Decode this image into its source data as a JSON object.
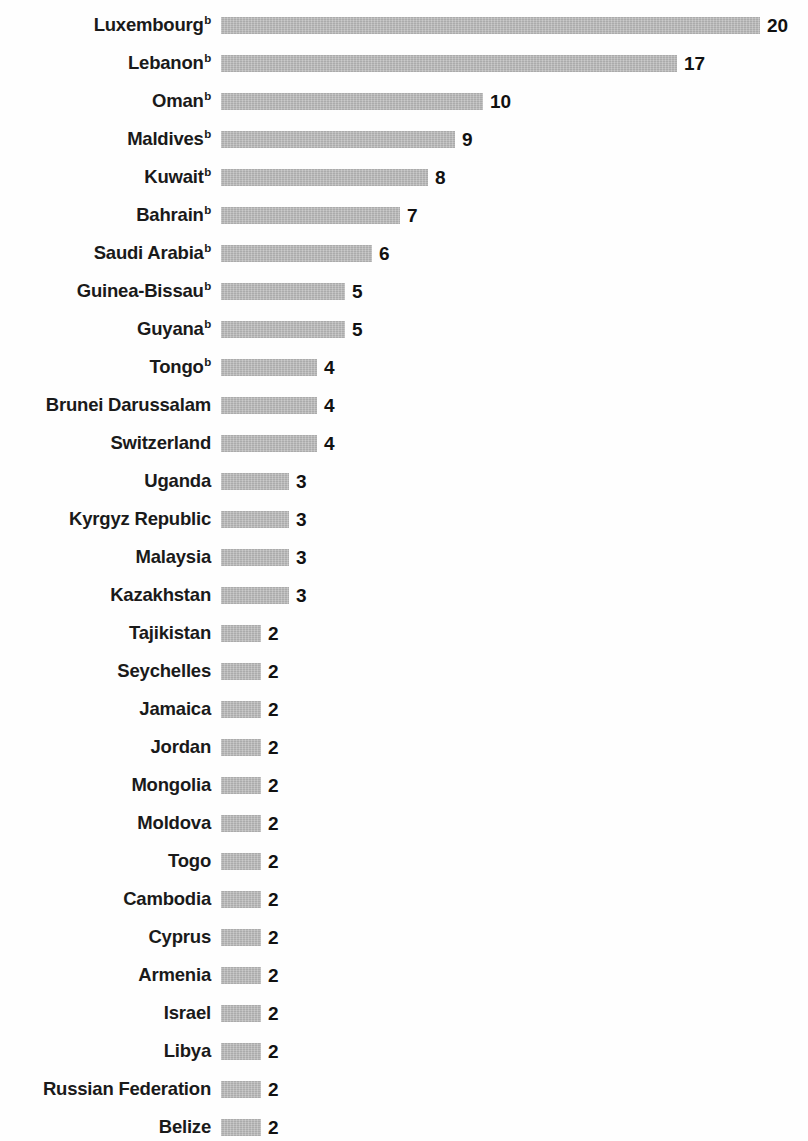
{
  "chart_data": {
    "type": "bar",
    "orientation": "horizontal",
    "title": "",
    "subtitle": "",
    "xlabel": "",
    "ylabel": "",
    "grid": false,
    "legend": null,
    "axis_visible": false,
    "value_labels_shown": true,
    "xlim": [
      0,
      20
    ],
    "bar_color": "#b4b4b4",
    "label_color": "#1a1a1a",
    "value_color": "#111111",
    "footnote_marker": "b",
    "categories": [
      "Luxembourg",
      "Lebanon",
      "Oman",
      "Maldives",
      "Kuwait",
      "Bahrain",
      "Saudi Arabia",
      "Guinea-Bissau",
      "Guyana",
      "Tongo",
      "Brunei Darussalam",
      "Switzerland",
      "Uganda",
      "Kyrgyz Republic",
      "Malaysia",
      "Kazakhstan",
      "Tajikistan",
      "Seychelles",
      "Jamaica",
      "Jordan",
      "Mongolia",
      "Moldova",
      "Togo",
      "Cambodia",
      "Cyprus",
      "Armenia",
      "Israel",
      "Libya",
      "Russian Federation",
      "Belize"
    ],
    "values": [
      20,
      17,
      10,
      9,
      8,
      7,
      6,
      5,
      5,
      4,
      4,
      4,
      3,
      3,
      3,
      3,
      2,
      2,
      2,
      2,
      2,
      2,
      2,
      2,
      2,
      2,
      2,
      2,
      2,
      2
    ],
    "rows": [
      {
        "label": "Luxembourg",
        "sup": "b",
        "value": 20,
        "value_text": "20"
      },
      {
        "label": "Lebanon",
        "sup": "b",
        "value": 17,
        "value_text": "17"
      },
      {
        "label": "Oman",
        "sup": "b",
        "value": 10,
        "value_text": "10"
      },
      {
        "label": "Maldives",
        "sup": "b",
        "value": 9,
        "value_text": "9"
      },
      {
        "label": "Kuwait",
        "sup": "b",
        "value": 8,
        "value_text": "8"
      },
      {
        "label": "Bahrain",
        "sup": "b",
        "value": 7,
        "value_text": "7"
      },
      {
        "label": "Saudi Arabia",
        "sup": "b",
        "value": 6,
        "value_text": "6"
      },
      {
        "label": "Guinea-Bissau",
        "sup": "b",
        "value": 5,
        "value_text": "5"
      },
      {
        "label": "Guyana",
        "sup": "b",
        "value": 5,
        "value_text": "5"
      },
      {
        "label": "Tongo",
        "sup": "b",
        "value": 4,
        "value_text": "4"
      },
      {
        "label": "Brunei Darussalam",
        "sup": "",
        "value": 4,
        "value_text": "4"
      },
      {
        "label": "Switzerland",
        "sup": "",
        "value": 4,
        "value_text": "4"
      },
      {
        "label": "Uganda",
        "sup": "",
        "value": 3,
        "value_text": "3"
      },
      {
        "label": "Kyrgyz Republic",
        "sup": "",
        "value": 3,
        "value_text": "3"
      },
      {
        "label": "Malaysia",
        "sup": "",
        "value": 3,
        "value_text": "3"
      },
      {
        "label": "Kazakhstan",
        "sup": "",
        "value": 3,
        "value_text": "3"
      },
      {
        "label": "Tajikistan",
        "sup": "",
        "value": 2,
        "value_text": "2"
      },
      {
        "label": "Seychelles",
        "sup": "",
        "value": 2,
        "value_text": "2"
      },
      {
        "label": "Jamaica",
        "sup": "",
        "value": 2,
        "value_text": "2"
      },
      {
        "label": "Jordan",
        "sup": "",
        "value": 2,
        "value_text": "2"
      },
      {
        "label": "Mongolia",
        "sup": "",
        "value": 2,
        "value_text": "2"
      },
      {
        "label": "Moldova",
        "sup": "",
        "value": 2,
        "value_text": "2"
      },
      {
        "label": "Togo",
        "sup": "",
        "value": 2,
        "value_text": "2"
      },
      {
        "label": "Cambodia",
        "sup": "",
        "value": 2,
        "value_text": "2"
      },
      {
        "label": "Cyprus",
        "sup": "",
        "value": 2,
        "value_text": "2"
      },
      {
        "label": "Armenia",
        "sup": "",
        "value": 2,
        "value_text": "2"
      },
      {
        "label": "Israel",
        "sup": "",
        "value": 2,
        "value_text": "2"
      },
      {
        "label": "Libya",
        "sup": "",
        "value": 2,
        "value_text": "2"
      },
      {
        "label": "Russian Federation",
        "sup": "",
        "value": 2,
        "value_text": "2"
      },
      {
        "label": "Belize",
        "sup": "",
        "value": 2,
        "value_text": "2"
      }
    ]
  },
  "layout": {
    "row_pitch_px": 38,
    "first_row_top_px": 6,
    "bar_start_x_px": 221,
    "px_per_unit": 27.7,
    "bar_height_px": 17,
    "label_right_edge_px": 211
  }
}
